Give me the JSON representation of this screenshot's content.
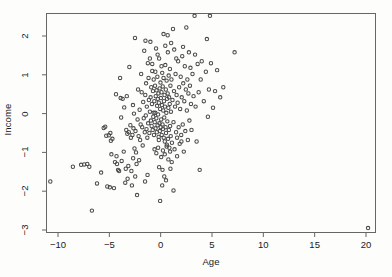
{
  "chart_data": {
    "type": "scatter",
    "title": "",
    "xlabel": "Age",
    "ylabel": "Income",
    "xlim": [
      -11.7,
      21.0
    ],
    "ylim": [
      -3.2,
      2.72
    ],
    "xticks": [
      -10,
      -5,
      0,
      5,
      10,
      15,
      20
    ],
    "xticklabels": [
      "-10",
      "-5",
      "0",
      "5",
      "10",
      "15",
      "20"
    ],
    "yticks": [
      2,
      1,
      0,
      -1,
      -2,
      -3
    ],
    "yticklabels": [
      "2",
      "1",
      "0",
      "-1",
      "-2",
      "-3"
    ],
    "grid": false,
    "legend": null,
    "marker": "open-circle",
    "marker_size": 3.4,
    "marker_color": "#4a4a4a",
    "axis_color": "#666666",
    "background": "#fdfdfb",
    "n_points": 252,
    "points": [
      [
        -10.75,
        -1.75
      ],
      [
        -8.55,
        -1.37
      ],
      [
        -7.75,
        -1.32
      ],
      [
        -7.45,
        -1.31
      ],
      [
        -7.15,
        -1.3
      ],
      [
        -6.95,
        -1.37
      ],
      [
        -6.7,
        -2.5
      ],
      [
        -6.2,
        -1.8
      ],
      [
        -5.8,
        -1.52
      ],
      [
        -5.55,
        -0.37
      ],
      [
        -5.4,
        -0.34
      ],
      [
        -5.3,
        -0.57
      ],
      [
        -5.2,
        -1.88
      ],
      [
        -5.05,
        -0.56
      ],
      [
        -4.95,
        -1.9
      ],
      [
        -4.9,
        -0.5
      ],
      [
        -4.85,
        -0.7
      ],
      [
        -4.8,
        -1.05
      ],
      [
        -4.7,
        -0.65
      ],
      [
        -4.55,
        -1.92
      ],
      [
        -4.45,
        -1.25
      ],
      [
        -4.35,
        0.5
      ],
      [
        -4.3,
        -1.1
      ],
      [
        -4.25,
        -1.3
      ],
      [
        -4.15,
        -1.45
      ],
      [
        -4.05,
        -1.48
      ],
      [
        -3.95,
        0.92
      ],
      [
        -3.9,
        0.4
      ],
      [
        -3.85,
        -0.1
      ],
      [
        -3.8,
        -1.22
      ],
      [
        -3.7,
        0.38
      ],
      [
        -3.6,
        -0.98
      ],
      [
        -3.55,
        0.16
      ],
      [
        -3.45,
        -1.78
      ],
      [
        -3.4,
        -1.42
      ],
      [
        -3.35,
        -0.42
      ],
      [
        -3.3,
        0.45
      ],
      [
        -3.25,
        -0.52
      ],
      [
        -3.15,
        -1.35
      ],
      [
        -3.1,
        -0.48
      ],
      [
        -3.05,
        1.2
      ],
      [
        -2.95,
        -0.3
      ],
      [
        -2.9,
        -0.62
      ],
      [
        -2.85,
        -1.48
      ],
      [
        -2.8,
        -1.85
      ],
      [
        -2.75,
        -0.55
      ],
      [
        -2.7,
        0.22
      ],
      [
        -2.65,
        -0.38
      ],
      [
        -2.6,
        0.0
      ],
      [
        -2.55,
        -0.9
      ],
      [
        -2.5,
        1.95
      ],
      [
        -2.45,
        -0.45
      ],
      [
        -2.4,
        -1.0
      ],
      [
        -2.35,
        -1.3
      ],
      [
        -2.3,
        -2.1
      ],
      [
        -2.25,
        -0.15
      ],
      [
        -2.2,
        0.62
      ],
      [
        -2.15,
        -0.58
      ],
      [
        -2.1,
        -1.2
      ],
      [
        -2.05,
        0.1
      ],
      [
        -2.0,
        -0.68
      ],
      [
        -1.95,
        -0.28
      ],
      [
        -1.9,
        1.02
      ],
      [
        -1.85,
        0.55
      ],
      [
        -1.8,
        -0.35
      ],
      [
        -1.75,
        -0.82
      ],
      [
        -1.7,
        0.3
      ],
      [
        -1.65,
        -0.12
      ],
      [
        -1.6,
        1.62
      ],
      [
        -1.55,
        -0.48
      ],
      [
        -1.5,
        0.48
      ],
      [
        -1.45,
        -0.05
      ],
      [
        -1.42,
        0.78
      ],
      [
        -1.38,
        -0.4
      ],
      [
        -1.35,
        0.18
      ],
      [
        -1.3,
        -0.62
      ],
      [
        -1.25,
        1.3
      ],
      [
        -1.22,
        -0.25
      ],
      [
        -1.18,
        0.92
      ],
      [
        -1.15,
        0.35
      ],
      [
        -1.1,
        -0.5
      ],
      [
        -1.05,
        0.05
      ],
      [
        -1.0,
        1.85
      ],
      [
        -0.98,
        0.42
      ],
      [
        -0.95,
        -0.18
      ],
      [
        -0.92,
        0.68
      ],
      [
        -0.88,
        -0.32
      ],
      [
        -0.85,
        0.25
      ],
      [
        -0.82,
        1.1
      ],
      [
        -0.78,
        -0.42
      ],
      [
        -0.75,
        0.58
      ],
      [
        -0.72,
        -0.08
      ],
      [
        -0.68,
        0.88
      ],
      [
        -0.65,
        -0.55
      ],
      [
        -0.62,
        0.32
      ],
      [
        -0.58,
        -0.22
      ],
      [
        -0.55,
        0.72
      ],
      [
        -0.52,
        0.02
      ],
      [
        -0.5,
        -0.38
      ],
      [
        -0.48,
        0.45
      ],
      [
        -0.45,
        1.68
      ],
      [
        -0.42,
        -0.12
      ],
      [
        -0.4,
        0.6
      ],
      [
        -0.38,
        -0.48
      ],
      [
        -0.35,
        0.2
      ],
      [
        -0.32,
        0.95
      ],
      [
        -0.3,
        -0.3
      ],
      [
        -0.28,
        0.38
      ],
      [
        -0.25,
        -0.02
      ],
      [
        -0.22,
        0.52
      ],
      [
        -0.2,
        -0.6
      ],
      [
        -0.18,
        0.28
      ],
      [
        -0.15,
        1.42
      ],
      [
        -0.12,
        -0.25
      ],
      [
        -0.1,
        0.65
      ],
      [
        -0.08,
        -0.45
      ],
      [
        -0.05,
        0.12
      ],
      [
        -0.02,
        0.8
      ],
      [
        0.0,
        -0.35
      ],
      [
        0.02,
        0.4
      ],
      [
        0.05,
        -0.15
      ],
      [
        0.08,
        0.55
      ],
      [
        0.1,
        -0.55
      ],
      [
        0.12,
        0.22
      ],
      [
        0.15,
        1.05
      ],
      [
        0.18,
        -0.28
      ],
      [
        0.2,
        0.7
      ],
      [
        0.22,
        -0.4
      ],
      [
        0.25,
        0.08
      ],
      [
        0.28,
        0.92
      ],
      [
        0.3,
        -0.62
      ],
      [
        0.32,
        0.32
      ],
      [
        0.35,
        -0.1
      ],
      [
        0.38,
        0.48
      ],
      [
        0.4,
        -0.72
      ],
      [
        0.42,
        0.18
      ],
      [
        0.45,
        1.25
      ],
      [
        0.48,
        -0.35
      ],
      [
        0.5,
        0.62
      ],
      [
        0.52,
        -0.5
      ],
      [
        0.55,
        0.02
      ],
      [
        0.58,
        0.85
      ],
      [
        0.6,
        -0.8
      ],
      [
        0.62,
        0.38
      ],
      [
        0.65,
        -0.2
      ],
      [
        0.68,
        0.52
      ],
      [
        0.7,
        1.58
      ],
      [
        0.72,
        -0.65
      ],
      [
        0.75,
        0.15
      ],
      [
        0.78,
        0.98
      ],
      [
        0.8,
        -0.42
      ],
      [
        0.82,
        0.42
      ],
      [
        0.85,
        -0.88
      ],
      [
        0.88,
        0.25
      ],
      [
        0.9,
        1.15
      ],
      [
        0.92,
        -0.32
      ],
      [
        0.95,
        0.72
      ],
      [
        0.98,
        -0.58
      ],
      [
        1.0,
        0.05
      ],
      [
        1.05,
        0.88
      ],
      [
        1.1,
        -0.75
      ],
      [
        1.15,
        0.35
      ],
      [
        1.2,
        2.18
      ],
      [
        1.25,
        -0.22
      ],
      [
        1.3,
        0.58
      ],
      [
        1.35,
        -0.92
      ],
      [
        1.4,
        0.18
      ],
      [
        1.45,
        1.02
      ],
      [
        1.5,
        -0.48
      ],
      [
        1.55,
        0.48
      ],
      [
        1.6,
        -1.1
      ],
      [
        1.65,
        0.28
      ],
      [
        1.7,
        1.35
      ],
      [
        1.75,
        -0.35
      ],
      [
        1.8,
        0.68
      ],
      [
        1.85,
        -0.78
      ],
      [
        1.9,
        0.12
      ],
      [
        1.95,
        0.95
      ],
      [
        2.0,
        -0.55
      ],
      [
        2.05,
        0.42
      ],
      [
        2.1,
        1.48
      ],
      [
        2.15,
        -0.28
      ],
      [
        2.2,
        0.78
      ],
      [
        2.25,
        -0.98
      ],
      [
        2.3,
        0.32
      ],
      [
        2.35,
        1.22
      ],
      [
        2.4,
        -0.45
      ],
      [
        2.45,
        0.62
      ],
      [
        2.5,
        2.22
      ],
      [
        2.55,
        0.08
      ],
      [
        2.6,
        0.88
      ],
      [
        2.65,
        -0.68
      ],
      [
        2.7,
        0.52
      ],
      [
        2.75,
        1.58
      ],
      [
        2.8,
        -0.18
      ],
      [
        2.85,
        0.72
      ],
      [
        2.9,
        1.18
      ],
      [
        2.95,
        0.25
      ],
      [
        3.0,
        -0.42
      ],
      [
        3.1,
        1.02
      ],
      [
        3.2,
        0.45
      ],
      [
        3.3,
        2.52
      ],
      [
        3.35,
        1.52
      ],
      [
        3.4,
        0.18
      ],
      [
        3.5,
        -0.72
      ],
      [
        3.6,
        1.28
      ],
      [
        3.7,
        0.55
      ],
      [
        3.8,
        -1.45
      ],
      [
        3.9,
        0.88
      ],
      [
        4.0,
        1.35
      ],
      [
        4.2,
        0.32
      ],
      [
        4.4,
        1.08
      ],
      [
        4.5,
        1.92
      ],
      [
        4.6,
        -0.08
      ],
      [
        4.7,
        0.62
      ],
      [
        4.8,
        2.52
      ],
      [
        4.9,
        1.3
      ],
      [
        5.1,
        0.15
      ],
      [
        5.3,
        0.58
      ],
      [
        5.5,
        1.12
      ],
      [
        5.8,
        0.42
      ],
      [
        6.1,
        0.68
      ],
      [
        7.2,
        1.58
      ],
      [
        20.2,
        -2.95
      ],
      [
        -0.6,
        -0.92
      ],
      [
        -0.42,
        -1.02
      ],
      [
        -0.25,
        -0.88
      ],
      [
        0.05,
        -1.12
      ],
      [
        0.22,
        -0.95
      ],
      [
        0.4,
        -1.05
      ],
      [
        0.58,
        -0.85
      ],
      [
        0.75,
        -1.18
      ],
      [
        0.92,
        -0.98
      ],
      [
        1.08,
        -1.25
      ],
      [
        -0.15,
        -1.38
      ],
      [
        0.18,
        -1.45
      ],
      [
        0.35,
        -1.62
      ],
      [
        0.52,
        -1.72
      ],
      [
        0.15,
        -1.85
      ],
      [
        -0.05,
        -2.25
      ],
      [
        0.95,
        -1.42
      ],
      [
        1.25,
        -1.98
      ],
      [
        -1.28,
        -1.58
      ],
      [
        -1.52,
        -1.75
      ],
      [
        -2.48,
        -1.62
      ],
      [
        -2.68,
        -1.15
      ],
      [
        -3.22,
        -1.68
      ],
      [
        1.6,
        -0.62
      ],
      [
        2.02,
        -0.72
      ],
      [
        -0.82,
        1.28
      ],
      [
        -0.52,
        1.08
      ],
      [
        -0.3,
        1.52
      ],
      [
        0.08,
        1.22
      ],
      [
        0.45,
        1.75
      ],
      [
        0.68,
        2.02
      ],
      [
        1.02,
        1.82
      ],
      [
        1.32,
        1.65
      ],
      [
        -1.05,
        1.42
      ],
      [
        -1.48,
        1.88
      ],
      [
        0.28,
        2.05
      ],
      [
        1.52,
        1.42
      ],
      [
        2.18,
        1.72
      ],
      [
        -0.68,
        0.02
      ],
      [
        -0.18,
        -0.68
      ]
    ]
  }
}
